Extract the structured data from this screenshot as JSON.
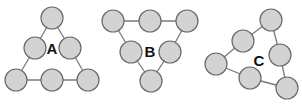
{
  "colors": {
    "node_fill": "#d3d3d3",
    "node_stroke": "#6a6a6a",
    "edge": "#7a7a7a",
    "label": "#111111"
  },
  "node_radius": 11,
  "figures": [
    {
      "label": "A",
      "label_pos": [
        52,
        48
      ],
      "nodes": [
        [
          52,
          18
        ],
        [
          35,
          48
        ],
        [
          70,
          48
        ],
        [
          16,
          80
        ],
        [
          52,
          80
        ],
        [
          88,
          80
        ]
      ],
      "edges": [
        [
          0,
          1
        ],
        [
          0,
          2
        ],
        [
          1,
          3
        ],
        [
          2,
          5
        ],
        [
          3,
          4
        ],
        [
          4,
          5
        ]
      ]
    },
    {
      "label": "B",
      "label_pos": [
        150,
        51
      ],
      "nodes": [
        [
          113,
          21
        ],
        [
          150,
          21
        ],
        [
          187,
          21
        ],
        [
          131,
          52
        ],
        [
          170,
          52
        ],
        [
          151,
          81
        ]
      ],
      "edges": [
        [
          0,
          1
        ],
        [
          1,
          2
        ],
        [
          0,
          3
        ],
        [
          2,
          4
        ],
        [
          3,
          5
        ],
        [
          4,
          5
        ]
      ]
    },
    {
      "label": "C",
      "label_pos": [
        259,
        60
      ],
      "nodes": [
        [
          271,
          20
        ],
        [
          243,
          41
        ],
        [
          280,
          55
        ],
        [
          216,
          64
        ],
        [
          250,
          78
        ],
        [
          287,
          88
        ]
      ],
      "edges": [
        [
          0,
          1
        ],
        [
          0,
          2
        ],
        [
          1,
          3
        ],
        [
          2,
          5
        ],
        [
          3,
          4
        ],
        [
          4,
          5
        ]
      ]
    }
  ]
}
